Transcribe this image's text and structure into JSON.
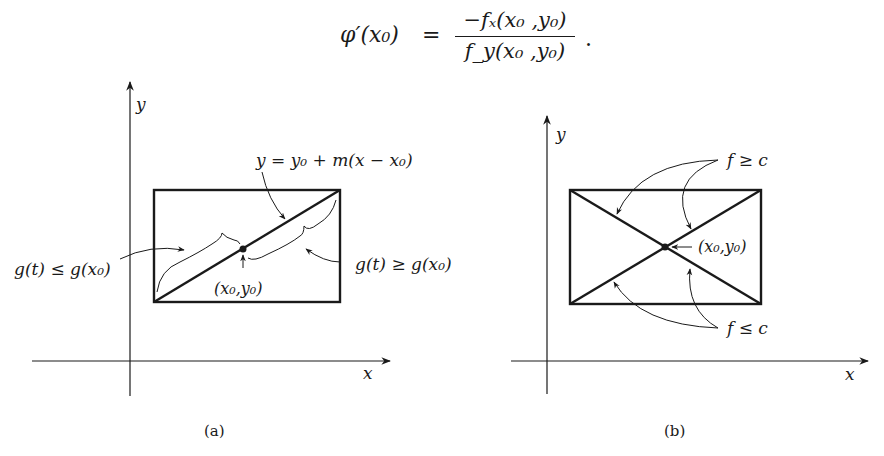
{
  "formula": {
    "lhs": "φ′(x₀)",
    "equals": "=",
    "numerator": "−fₓ(x₀ ,y₀)",
    "denominator": "f_y(x₀ ,y₀)",
    "trailing": "."
  },
  "figure_a": {
    "caption": "(a)",
    "x_axis_label": "x",
    "y_axis_label": "y",
    "line_label": "y = y₀ + m(x − x₀)",
    "left_brace_label": "g(t) ≤ g(x₀)",
    "right_brace_label": "g(t) ≥ g(x₀)",
    "point_label": "(x₀,y₀)"
  },
  "figure_b": {
    "caption": "(b)",
    "x_axis_label": "x",
    "y_axis_label": "y",
    "upper_label": "f ≥ c",
    "lower_label": "f ≤ c",
    "point_label": "(x₀,y₀)"
  }
}
